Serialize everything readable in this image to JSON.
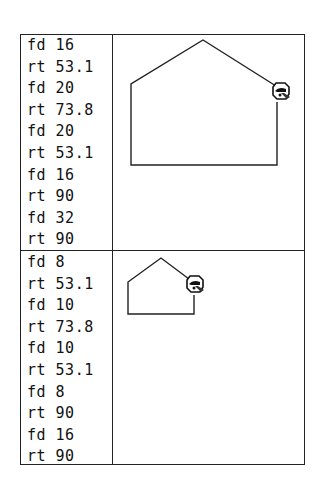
{
  "panels": [
    {
      "name": "large-house",
      "commands": [
        "fd 16",
        "rt 53.1",
        "fd 20",
        "rt 73.8",
        "fd 20",
        "rt 53.1",
        "fd 16",
        "rt 90",
        "fd 32",
        "rt 90"
      ],
      "drawing": {
        "path": "M277,102 L277,165 L131,165 L131,84 L203,40 L276,86",
        "turtle": {
          "x": 281,
          "y": 91
        }
      }
    },
    {
      "name": "small-house",
      "commands": [
        "fd 8",
        "rt 53.1",
        "fd 10",
        "rt 73.8",
        "fd 10",
        "rt 53.1",
        "fd 8",
        "rt 90",
        "fd 16",
        "rt 90"
      ],
      "drawing": {
        "path": "M194,295 L194,314 L128,314 L128,282 L161,258 L189,279",
        "turtle": {
          "x": 195,
          "y": 284
        }
      }
    }
  ],
  "colors": {
    "line": "#222222",
    "background": "#ffffff"
  },
  "icons": {
    "turtle": "turtle-icon"
  }
}
